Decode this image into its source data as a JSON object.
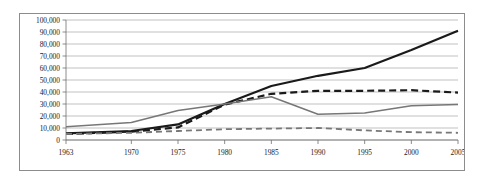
{
  "chart_data": {
    "type": "line",
    "title": "",
    "subtitle": "",
    "xlabel": "",
    "ylabel": "",
    "grid": "horizontal",
    "legend": "none",
    "xlim": [
      1963,
      2005
    ],
    "ylim": [
      0,
      100000
    ],
    "y_ticks": [
      0,
      10000,
      20000,
      30000,
      40000,
      50000,
      60000,
      70000,
      80000,
      90000,
      100000
    ],
    "y_tick_labels": [
      "0",
      "10,000",
      "20,000",
      "30,000",
      "40,000",
      "50,000",
      "60,000",
      "70,000",
      "80,000",
      "90,000",
      "100,000"
    ],
    "x_ticks": [
      1963,
      1970,
      1975,
      1980,
      1985,
      1990,
      1995,
      2000,
      2005
    ],
    "x_tick_labels": [
      "1963",
      "1970",
      "1975",
      "1980",
      "1985",
      "1990",
      "1995",
      "2000",
      "2005"
    ],
    "x": [
      1963,
      1970,
      1975,
      1980,
      1985,
      1990,
      1995,
      2000,
      2005
    ],
    "series": [
      {
        "name": "black-solid-series",
        "color": "#1a1a1a",
        "width": 2.2,
        "dash": "none",
        "values": [
          5500,
          7500,
          13000,
          30000,
          45000,
          53500,
          60000,
          75000,
          91000
        ]
      },
      {
        "name": "black-dashed-series",
        "color": "#1a1a1a",
        "width": 2.2,
        "dash": "7,4",
        "values": [
          5000,
          7000,
          10500,
          29500,
          38500,
          41000,
          41000,
          41500,
          39500
        ]
      },
      {
        "name": "gray-solid-series",
        "color": "#777777",
        "width": 1.5,
        "dash": "none",
        "values": [
          11000,
          14500,
          24500,
          30000,
          36000,
          21500,
          22500,
          28500,
          29500
        ]
      },
      {
        "name": "gray-dashed-series",
        "color": "#777777",
        "width": 1.8,
        "dash": "6,4",
        "values": [
          5000,
          6000,
          7500,
          9000,
          9500,
          10000,
          8000,
          6500,
          6000
        ]
      }
    ]
  }
}
